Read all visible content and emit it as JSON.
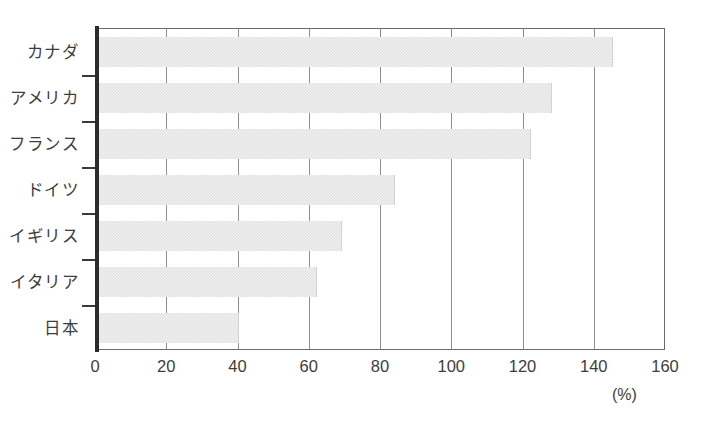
{
  "chart_data": {
    "type": "bar",
    "orientation": "horizontal",
    "title": "",
    "subtitle": "",
    "xlabel": "",
    "ylabel": "",
    "unit_label": "(%)",
    "categories": [
      "カナダ",
      "アメリカ",
      "フランス",
      "ドイツ",
      "イギリス",
      "イタリア",
      "日本"
    ],
    "values": [
      145,
      128,
      122,
      84,
      69,
      62,
      40
    ],
    "series": [
      {
        "name": "",
        "values": [
          145,
          128,
          122,
          84,
          69,
          62,
          40
        ]
      }
    ],
    "xlim": [
      0,
      160
    ],
    "xticks": [
      0,
      20,
      40,
      60,
      80,
      100,
      120,
      140,
      160
    ],
    "xtick_labels": [
      "0",
      "20",
      "40",
      "60",
      "80",
      "100",
      "120",
      "140",
      "160"
    ],
    "grid": true,
    "grid_axis": "x",
    "legend": false,
    "legend_position": "none",
    "bar_color": "#e3e3e3",
    "axis_color": "#2b2b2b",
    "gridline_color": "#8e8e8e",
    "text_color": "#3d3d3d"
  }
}
